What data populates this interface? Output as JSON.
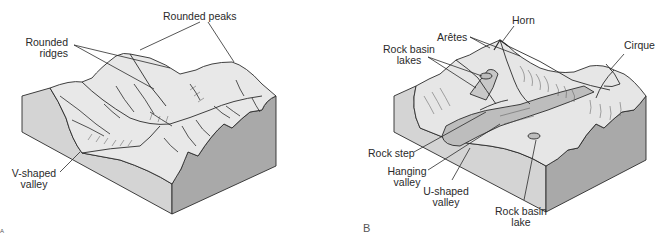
{
  "figure": {
    "panel_a": {
      "letter": "A",
      "title": "Stream-eroded (unglaciated) mountain landscape",
      "labels": {
        "rounded_peaks": "Rounded peaks",
        "rounded_ridges_1": "Rounded",
        "rounded_ridges_2": "ridges",
        "v_valley_1": "V-shaped",
        "v_valley_2": "valley"
      }
    },
    "panel_b": {
      "letter": "B",
      "title": "Glaciated mountain landscape",
      "labels": {
        "horn": "Horn",
        "aretes": "Arêtes",
        "rock_basin_lakes_1": "Rock basin",
        "rock_basin_lakes_2": "lakes",
        "cirque": "Cirque",
        "rock_step": "Rock step",
        "hanging_valley_1": "Hanging",
        "hanging_valley_2": "valley",
        "u_valley_1": "U-shaped",
        "u_valley_2": "valley",
        "rock_basin_lake_1": "Rock basin",
        "rock_basin_lake_2": "lake"
      }
    },
    "colors": {
      "background": "#ffffff",
      "surface": "#e6e6e6",
      "front_face": "#d2d2d2",
      "side_face": "#a9a9a9",
      "line": "#2b2b2b",
      "valley_fill": "#bdbdbd"
    }
  }
}
